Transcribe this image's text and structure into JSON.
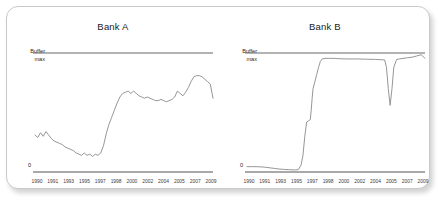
{
  "card": {
    "background": "#ffffff",
    "border_color": "#c9c9c9"
  },
  "panels": [
    {
      "key": "bank_a",
      "title": "Bank A",
      "y_top_label_line1": "Buffer",
      "y_top_label_line2": "max",
      "y_zero_label": "0"
    },
    {
      "key": "bank_b",
      "title": "Bank B",
      "y_top_label_line1": "Buffer",
      "y_top_label_line2": "max",
      "y_zero_label": "0"
    }
  ],
  "chart_data": [
    {
      "type": "line",
      "title": "Bank A",
      "xlabel": "",
      "ylabel": "",
      "ylim": [
        0,
        1
      ],
      "grid": false,
      "legend": "none",
      "line_color": "#8a8a8a",
      "reference_lines": [
        {
          "label": "Buffer max",
          "value": 1.0
        },
        {
          "label": "0",
          "value": 0.0
        }
      ],
      "tick_labels": [
        "1990",
        "1991",
        "1993",
        "1995",
        "1997",
        "1998",
        "2000",
        "2002",
        "2004",
        "2005",
        "2007",
        "2009"
      ],
      "x": [
        1990.0,
        1990.3,
        1990.6,
        1990.9,
        1991.2,
        1991.5,
        1991.8,
        1992.1,
        1992.4,
        1992.7,
        1993.0,
        1993.3,
        1993.6,
        1993.9,
        1994.2,
        1994.5,
        1994.8,
        1995.1,
        1995.4,
        1995.7,
        1996.0,
        1996.3,
        1996.6,
        1996.9,
        1997.2,
        1997.5,
        1997.8,
        1998.1,
        1998.4,
        1998.7,
        1999.0,
        1999.3,
        1999.6,
        1999.9,
        2000.2,
        2000.5,
        2000.8,
        2001.1,
        2001.4,
        2001.7,
        2002.0,
        2002.3,
        2002.6,
        2002.9,
        2003.2,
        2003.5,
        2003.8,
        2004.1,
        2004.4,
        2004.7,
        2005.0,
        2005.3,
        2005.6,
        2005.9,
        2006.2,
        2006.5,
        2006.8,
        2007.1,
        2007.4,
        2007.7,
        2008.0,
        2008.3,
        2008.6,
        2008.9,
        2009.2,
        2009.5
      ],
      "values": [
        0.31,
        0.29,
        0.33,
        0.3,
        0.34,
        0.31,
        0.28,
        0.26,
        0.25,
        0.24,
        0.23,
        0.21,
        0.2,
        0.19,
        0.18,
        0.16,
        0.15,
        0.14,
        0.16,
        0.14,
        0.15,
        0.13,
        0.15,
        0.14,
        0.16,
        0.22,
        0.32,
        0.4,
        0.46,
        0.52,
        0.58,
        0.63,
        0.66,
        0.67,
        0.68,
        0.66,
        0.68,
        0.66,
        0.64,
        0.63,
        0.62,
        0.63,
        0.62,
        0.61,
        0.6,
        0.6,
        0.61,
        0.6,
        0.59,
        0.6,
        0.61,
        0.63,
        0.68,
        0.66,
        0.64,
        0.67,
        0.71,
        0.76,
        0.8,
        0.81,
        0.81,
        0.8,
        0.78,
        0.76,
        0.74,
        0.62
      ]
    },
    {
      "type": "line",
      "title": "Bank B",
      "xlabel": "",
      "ylabel": "",
      "ylim": [
        0,
        1
      ],
      "grid": false,
      "legend": "none",
      "line_color": "#8a8a8a",
      "reference_lines": [
        {
          "label": "Buffer max",
          "value": 1.0
        },
        {
          "label": "0",
          "value": 0.0
        }
      ],
      "tick_labels": [
        "1990",
        "1991",
        "1993",
        "1995",
        "1997",
        "1998",
        "2000",
        "2002",
        "2004",
        "2005",
        "2007",
        "2009"
      ],
      "x": [
        1990.0,
        1990.5,
        1991.0,
        1991.5,
        1992.0,
        1992.5,
        1993.0,
        1993.5,
        1994.0,
        1994.5,
        1995.0,
        1995.3,
        1995.6,
        1995.9,
        1996.1,
        1996.3,
        1996.5,
        1996.7,
        1996.9,
        1997.0,
        1997.1,
        1997.2,
        1997.4,
        1997.6,
        1997.8,
        1998.0,
        1998.2,
        1998.5,
        1999.0,
        1999.5,
        2000.0,
        2001.0,
        2002.0,
        2003.0,
        2004.0,
        2004.5,
        2005.0,
        2005.2,
        2005.4,
        2005.6,
        2005.8,
        2006.0,
        2006.3,
        2006.6,
        2007.0,
        2007.5,
        2008.0,
        2008.5,
        2009.0,
        2009.4
      ],
      "values": [
        0.045,
        0.045,
        0.045,
        0.043,
        0.04,
        0.035,
        0.03,
        0.025,
        0.022,
        0.02,
        0.018,
        0.018,
        0.02,
        0.06,
        0.14,
        0.3,
        0.42,
        0.43,
        0.44,
        0.52,
        0.62,
        0.7,
        0.76,
        0.82,
        0.88,
        0.93,
        0.95,
        0.955,
        0.955,
        0.955,
        0.952,
        0.95,
        0.95,
        0.948,
        0.946,
        0.944,
        0.942,
        0.88,
        0.7,
        0.56,
        0.7,
        0.88,
        0.945,
        0.95,
        0.955,
        0.96,
        0.965,
        0.975,
        0.985,
        0.955
      ]
    }
  ]
}
